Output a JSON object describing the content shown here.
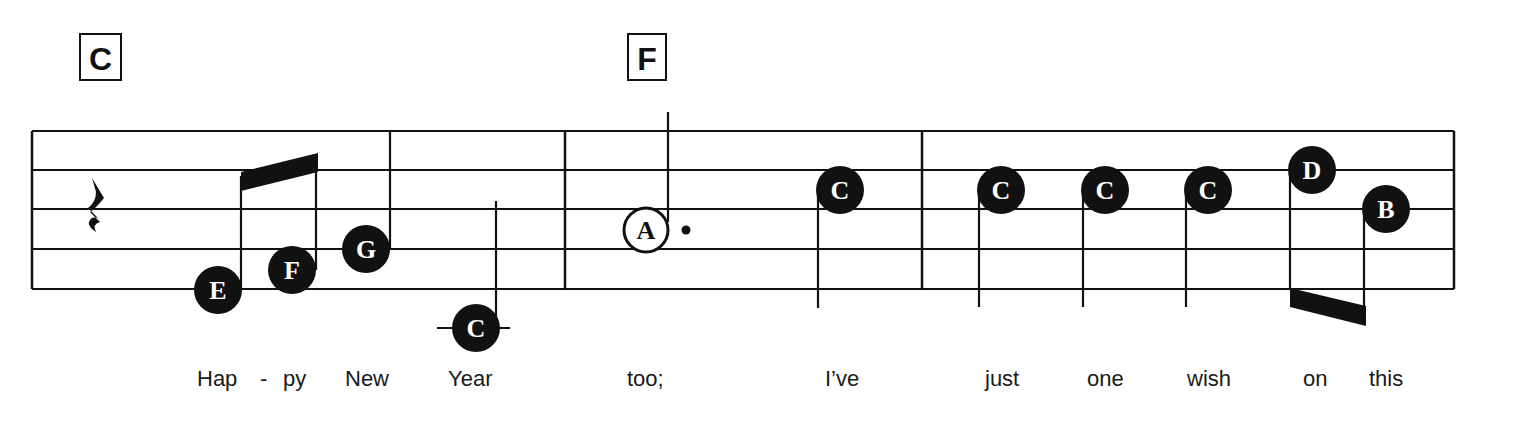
{
  "chords": [
    {
      "label": "C",
      "x": 80,
      "y": 34,
      "w": 41,
      "h": 46
    },
    {
      "label": "F",
      "x": 628,
      "y": 34,
      "w": 38,
      "h": 46
    }
  ],
  "staff": {
    "x1": 32,
    "x2": 1454,
    "lines_y": [
      131,
      170,
      209,
      249,
      289
    ],
    "barlines_x": [
      32,
      565,
      922,
      1454
    ],
    "color": "#111111"
  },
  "measures": [
    {
      "index": 1,
      "rest": {
        "type": "quarter",
        "x": 98,
        "y": 210
      },
      "notes": [
        {
          "letter": "E",
          "cx": 218,
          "cy": 290,
          "filled": true,
          "stem": {
            "x": 241,
            "y1": 290,
            "y2": 176
          }
        },
        {
          "letter": "F",
          "cx": 292,
          "cy": 270,
          "filled": true,
          "stem": {
            "x": 316,
            "y1": 270,
            "y2": 154
          }
        },
        {
          "letter": "G",
          "cx": 366,
          "cy": 249,
          "filled": true,
          "stem": {
            "x": 390,
            "y1": 249,
            "y2": 131
          }
        },
        {
          "letter": "C",
          "cx": 476,
          "cy": 328,
          "filled": true,
          "ledger": {
            "x1": 437,
            "x2": 510
          },
          "stem": {
            "x": 496,
            "y1": 328,
            "y2": 201
          }
        }
      ],
      "beam": {
        "points": "241,172 318,153 318,172 241,191"
      },
      "lyrics": [
        {
          "text": "Hap",
          "x": 197
        },
        {
          "text": "-",
          "x": 260
        },
        {
          "text": "py",
          "x": 283
        },
        {
          "text": "New",
          "x": 345
        },
        {
          "text": "Year",
          "x": 448
        }
      ]
    },
    {
      "index": 2,
      "notes": [
        {
          "letter": "A",
          "cx": 646,
          "cy": 230,
          "filled": false,
          "dotted": true,
          "dot": {
            "cx": 686,
            "cy": 230
          },
          "stem": {
            "x": 668,
            "y1": 222,
            "y2": 112
          }
        },
        {
          "letter": "C",
          "cx": 840,
          "cy": 190,
          "filled": true,
          "stem": {
            "x": 818,
            "y1": 195,
            "y2": 308
          }
        }
      ],
      "lyrics": [
        {
          "text": "too;",
          "x": 627
        },
        {
          "text": "I’ve",
          "x": 825
        }
      ]
    },
    {
      "index": 3,
      "notes": [
        {
          "letter": "C",
          "cx": 1001,
          "cy": 190,
          "filled": true,
          "stem": {
            "x": 979,
            "y1": 195,
            "y2": 307
          }
        },
        {
          "letter": "C",
          "cx": 1105,
          "cy": 190,
          "filled": true,
          "stem": {
            "x": 1083,
            "y1": 195,
            "y2": 307
          }
        },
        {
          "letter": "C",
          "cx": 1208,
          "cy": 190,
          "filled": true,
          "stem": {
            "x": 1186,
            "y1": 195,
            "y2": 307
          }
        },
        {
          "letter": "D",
          "cx": 1312,
          "cy": 170,
          "filled": true,
          "stem": {
            "x": 1290,
            "y1": 175,
            "y2": 290
          }
        },
        {
          "letter": "B",
          "cx": 1386,
          "cy": 209,
          "filled": true,
          "stem": {
            "x": 1364,
            "y1": 214,
            "y2": 318
          }
        }
      ],
      "beam": {
        "points": "1290,288 1366,306 1366,326 1290,307"
      },
      "lyrics": [
        {
          "text": "just",
          "x": 985
        },
        {
          "text": "one",
          "x": 1087
        },
        {
          "text": "wish",
          "x": 1187
        },
        {
          "text": "on",
          "x": 1303
        },
        {
          "text": "this",
          "x": 1369
        }
      ]
    }
  ],
  "lyrics_y": 386,
  "note_radius": 24,
  "colors": {
    "ink": "#111111",
    "paper": "#ffffff",
    "note_text": "#ffffff"
  }
}
